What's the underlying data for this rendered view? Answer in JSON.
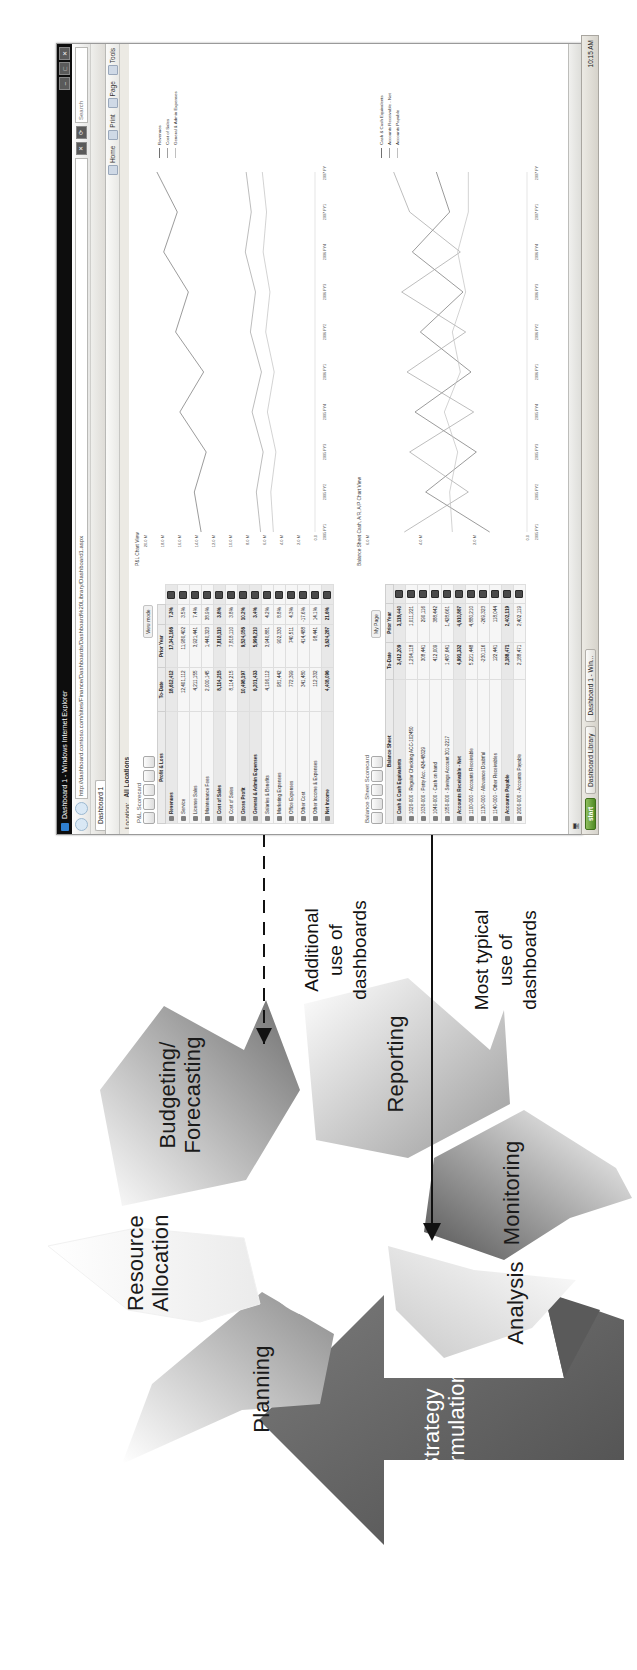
{
  "diagram": {
    "type": "closed-loop cycle",
    "segments": [
      {
        "id": "strategy-formulation",
        "label": "Strategy\nFormulation",
        "fill": "#6e6e6e",
        "text_color": "#ffffff"
      },
      {
        "id": "planning",
        "label": "Planning",
        "fill": "#b9b9b9",
        "text_color": "#1a1a1a"
      },
      {
        "id": "resource-allocation",
        "label": "Resource\nAllocation",
        "fill": "#f2f2f2",
        "text_color": "#1a1a1a"
      },
      {
        "id": "budgeting-forecasting",
        "label": "Budgeting/\nForecasting",
        "fill": "#9a9a9a",
        "text_color": "#1a1a1a"
      },
      {
        "id": "reporting",
        "label": "Reporting",
        "fill": "#cfcfcf",
        "text_color": "#1a1a1a"
      },
      {
        "id": "monitoring",
        "label": "Monitoring",
        "fill": "#808080",
        "text_color": "#1a1a1a"
      },
      {
        "id": "analysis",
        "label": "Analysis",
        "fill": "#e3e3e3",
        "text_color": "#1a1a1a"
      }
    ]
  },
  "annotations": [
    {
      "id": "additional-use",
      "text": "Additional\nuse of\ndashboards",
      "arrow": "dashed",
      "points_to": "analysis"
    },
    {
      "id": "most-typical-use",
      "text": "Most typical\nuse of\ndashboards",
      "arrow": "solid",
      "points_to": "monitoring"
    }
  ],
  "browser": {
    "title": "Dashboard 1 - Windows Internet Explorer",
    "address": "http://dashboard.contoso.com/sites/Finance/Dashboards/Dashboard%20Library/Dashboard1.aspx",
    "search_placeholder": "Search",
    "tab_label": "Dashboard 1",
    "menu": [
      {
        "label": "Home"
      },
      {
        "label": "Print"
      },
      {
        "label": "Page"
      },
      {
        "label": "Tools"
      }
    ],
    "winbuttons": [
      "–",
      "□",
      "✕"
    ],
    "location": {
      "label": "Location:",
      "value": "All Locations"
    }
  },
  "page": {
    "pl_panel": {
      "caption": "P&L Scorecard",
      "title": "Profit & Loss",
      "columns": [
        "",
        "To-Date",
        "Prior Year",
        ""
      ],
      "rows": [
        {
          "label": "Revenues",
          "values": [
            "18,612,412",
            "17,342,166",
            "7.3%"
          ],
          "type": "header"
        },
        {
          "label": "Service",
          "values": [
            "12,401,112",
            "11,980,402",
            "3.5%"
          ],
          "type": "item"
        },
        {
          "label": "License Sales",
          "values": [
            "4,211,155",
            "3,921,441",
            "7.4%"
          ],
          "type": "item"
        },
        {
          "label": "Maintenance Fees",
          "values": [
            "2,000,145",
            "1,440,323",
            "38.9%"
          ],
          "type": "item"
        },
        {
          "label": "Cost of Sales",
          "values": [
            "8,114,215",
            "7,818,110",
            "3.8%"
          ],
          "type": "header"
        },
        {
          "label": "Cost of Sales",
          "values": [
            "8,114,215",
            "7,818,110",
            "3.8%"
          ],
          "type": "item"
        },
        {
          "label": "Gross Profit",
          "values": [
            "10,498,197",
            "9,524,056",
            "10.2%"
          ],
          "type": "total"
        },
        {
          "label": "General & Admin Expenses",
          "values": [
            "6,201,433",
            "5,998,210",
            "3.4%"
          ],
          "type": "header"
        },
        {
          "label": "Salaries & Benefits",
          "values": [
            "4,106,112",
            "3,940,881",
            "4.2%"
          ],
          "type": "item"
        },
        {
          "label": "Marketing Expenses",
          "values": [
            "981,442",
            "902,330",
            "8.8%"
          ],
          "type": "item"
        },
        {
          "label": "Office Expenses",
          "values": [
            "772,399",
            "740,511",
            "4.3%"
          ],
          "type": "item"
        },
        {
          "label": "Other Cost",
          "values": [
            "341,480",
            "414,488",
            "-17.6%"
          ],
          "type": "item"
        },
        {
          "label": "Other Income & Expenses",
          "values": [
            "112,332",
            "98,441",
            "14.1%"
          ],
          "type": "item"
        },
        {
          "label": "Net Income",
          "values": [
            "4,408,096",
            "3,624,287",
            "21.6%"
          ],
          "type": "total"
        }
      ]
    },
    "bs_panel": {
      "caption": "Balance Sheet Scorecard",
      "title": "Balance Sheet",
      "columns": [
        "",
        "To-Date",
        "Prior Year"
      ],
      "rows": [
        {
          "label": "Cash & Cash Equivalents",
          "values": [
            "3,412,209",
            "3,118,440"
          ],
          "type": "header"
        },
        {
          "label": "1020-000 - Regular Checking ACC-102450",
          "values": [
            "1,204,118",
            "1,011,221"
          ],
          "type": "item"
        },
        {
          "label": "1030-000 - Petty Acc. 424-48029",
          "values": [
            "308,441",
            "290,116"
          ],
          "type": "item"
        },
        {
          "label": "1040-000 - Cash on hand",
          "values": [
            "412,009",
            "388,442"
          ],
          "type": "item"
        },
        {
          "label": "1050-000 - Savings Account 301-2217",
          "values": [
            "1,487,641",
            "1,428,661"
          ],
          "type": "item"
        },
        {
          "label": "Accounts Receivable - Net",
          "values": [
            "4,991,332",
            "4,610,887"
          ],
          "type": "header"
        },
        {
          "label": "1100-000 - Accounts Receivable",
          "values": [
            "5,221,448",
            "4,880,210"
          ],
          "type": "item"
        },
        {
          "label": "1130-000 - Allowance Doubtful",
          "values": [
            "-230,116",
            "-269,323"
          ],
          "type": "item"
        },
        {
          "label": "1140-000 - Other Receivables",
          "values": [
            "122,441",
            "118,044"
          ],
          "type": "item"
        },
        {
          "label": "Accounts Payable",
          "values": [
            "2,188,471",
            "2,402,119"
          ],
          "type": "header"
        },
        {
          "label": "2000-000 - Accounts Payable",
          "values": [
            "2,188,471",
            "2,402,119"
          ],
          "type": "item"
        }
      ]
    },
    "buttons": {
      "view_mode": "View mode",
      "my_page": "My Page"
    }
  },
  "chart_data": [
    {
      "id": "pl-trend-chart",
      "type": "line",
      "title": "P&L Chart View",
      "xlabel": "",
      "ylabel": "",
      "grid": false,
      "legend_position": "right",
      "categories": [
        "2005 FY1",
        "2005 FY2",
        "2005 FY3",
        "2005 FY4",
        "2006 FY1",
        "2006 FY2",
        "2006 FY3",
        "2006 FY4",
        "2007 FY1",
        "2007 FY2"
      ],
      "ytick_labels": [
        "20.0 M",
        "18.0 M",
        "16.0 M",
        "14.0 M",
        "12.0 M",
        "10.0 M",
        "8.0 M",
        "6.0 M",
        "4.0 M",
        "2.0 M",
        "0.0"
      ],
      "ylim": [
        0,
        20
      ],
      "series": [
        {
          "name": "Revenues",
          "values": [
            13.4,
            14.2,
            12.8,
            15.9,
            13.1,
            16.4,
            14.9,
            17.8,
            16.2,
            18.6
          ]
        },
        {
          "name": "Cost of Sales",
          "values": [
            6.4,
            6.9,
            6.1,
            7.4,
            6.3,
            7.6,
            7.0,
            8.2,
            7.5,
            8.1
          ]
        },
        {
          "name": "General & Admin Expenses",
          "values": [
            4.9,
            5.2,
            4.6,
            5.6,
            4.8,
            5.8,
            5.3,
            6.1,
            5.7,
            6.2
          ]
        }
      ]
    },
    {
      "id": "balance-sheet-chart",
      "type": "line",
      "title": "Balance Sheet Cash, A/R, A/P Chart View",
      "xlabel": "",
      "ylabel": "",
      "grid": false,
      "legend_position": "right",
      "categories": [
        "2005 FY1",
        "2005 FY2",
        "2005 FY3",
        "2005 FY4",
        "2006 FY1",
        "2006 FY2",
        "2006 FY3",
        "2006 FY4",
        "2007 FY1",
        "2007 FY2"
      ],
      "ytick_labels": [
        "6.0 M",
        "4.0 M",
        "2.0 M",
        "0.0"
      ],
      "ylim": [
        0,
        6
      ],
      "series": [
        {
          "name": "Cash & Cash Equivalents",
          "values": [
            1.4,
            3.8,
            1.9,
            4.2,
            2.1,
            4.0,
            2.4,
            4.3,
            2.9,
            3.4
          ]
        },
        {
          "name": "Accounts Receivable - Net",
          "values": [
            4.6,
            2.2,
            4.4,
            2.0,
            4.5,
            2.3,
            4.7,
            2.5,
            4.4,
            5.0
          ]
        },
        {
          "name": "Accounts Payable",
          "values": [
            2.8,
            2.9,
            2.6,
            3.1,
            2.5,
            2.8,
            2.3,
            2.6,
            2.2,
            2.2
          ]
        }
      ]
    }
  ],
  "taskbar": {
    "start": "start",
    "tasks": [
      {
        "label": "Dashboard Library"
      },
      {
        "label": "Dashboard 1 - Win..."
      }
    ],
    "clock": "10:15 AM"
  }
}
